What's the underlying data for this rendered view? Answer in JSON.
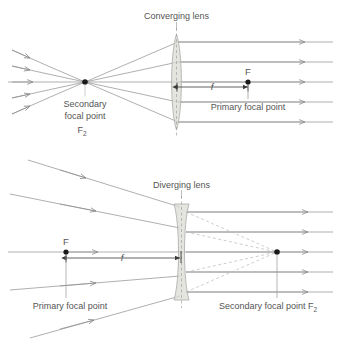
{
  "figure": {
    "colors": {
      "ray": "#8c8c8c",
      "ray_dashed": "#b0b0b0",
      "axis": "#8c8c8c",
      "lens_fill": "#dcdcd4",
      "lens_stroke": "#a9a9a9",
      "text": "#555555",
      "dot": "#1a1a1a",
      "dim": "#3a3a3a",
      "background": "#ffffff"
    }
  },
  "top_panel": {
    "lens_label": "Converging lens",
    "focal_length_symbol": "f",
    "focal_point_label": "F",
    "primary_focal_point_label": "Primary focal point",
    "secondary_focal_point_line1": "Secondary",
    "secondary_focal_point_line2": "focal point",
    "secondary_focal_point_symbol": "F",
    "secondary_focal_point_subscript": "2",
    "ray_count": 5,
    "lens_type": "biconvex"
  },
  "bottom_panel": {
    "lens_label": "Diverging lens",
    "focal_length_symbol": "f",
    "focal_point_label": "F",
    "primary_focal_point_label": "Primary focal point",
    "secondary_focal_point_label": "Secondary focal point F",
    "secondary_focal_point_subscript": "2",
    "ray_count": 5,
    "lens_type": "biconcave"
  }
}
